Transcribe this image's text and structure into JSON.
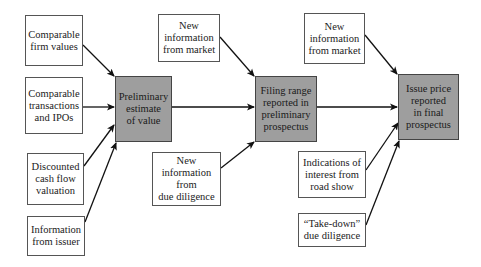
{
  "diagram": {
    "type": "flowchart",
    "colors": {
      "stage_fill": "#9e9e9e",
      "input_fill": "#ffffff",
      "border": "#555555",
      "arrow": "#111111"
    },
    "stages": [
      {
        "id": "preliminary",
        "label": "Preliminary\nestimate\nof value"
      },
      {
        "id": "filing",
        "label": "Filing range\nreported in\npreliminary\nprospectus"
      },
      {
        "id": "issue",
        "label": "Issue price\nreported\nin final\nprospectus"
      }
    ],
    "inputs": [
      {
        "id": "comp-firm",
        "label": "Comparable\nfirm values",
        "target": "preliminary"
      },
      {
        "id": "comp-trans",
        "label": "Comparable\ntransactions\nand IPOs",
        "target": "preliminary"
      },
      {
        "id": "dcf",
        "label": "Discounted\ncash flow\nvaluation",
        "target": "preliminary"
      },
      {
        "id": "issuer",
        "label": "Information\nfrom issuer",
        "target": "preliminary"
      },
      {
        "id": "market-1",
        "label": "New\ninformation\nfrom market",
        "target": "filing"
      },
      {
        "id": "due-dil",
        "label": "New\ninformation\nfrom\ndue diligence",
        "target": "filing"
      },
      {
        "id": "market-2",
        "label": "New\ninformation\nfrom market",
        "target": "issue"
      },
      {
        "id": "road-show",
        "label": "Indications of\ninterest from\nroad show",
        "target": "issue"
      },
      {
        "id": "take-down",
        "label": "“Take-down”\ndue diligence",
        "target": "issue"
      }
    ],
    "edges": [
      {
        "from": "comp-firm",
        "to": "preliminary"
      },
      {
        "from": "comp-trans",
        "to": "preliminary"
      },
      {
        "from": "dcf",
        "to": "preliminary"
      },
      {
        "from": "issuer",
        "to": "preliminary"
      },
      {
        "from": "preliminary",
        "to": "filing"
      },
      {
        "from": "market-1",
        "to": "filing"
      },
      {
        "from": "due-dil",
        "to": "filing"
      },
      {
        "from": "filing",
        "to": "issue"
      },
      {
        "from": "market-2",
        "to": "issue"
      },
      {
        "from": "road-show",
        "to": "issue"
      },
      {
        "from": "take-down",
        "to": "issue"
      }
    ]
  }
}
